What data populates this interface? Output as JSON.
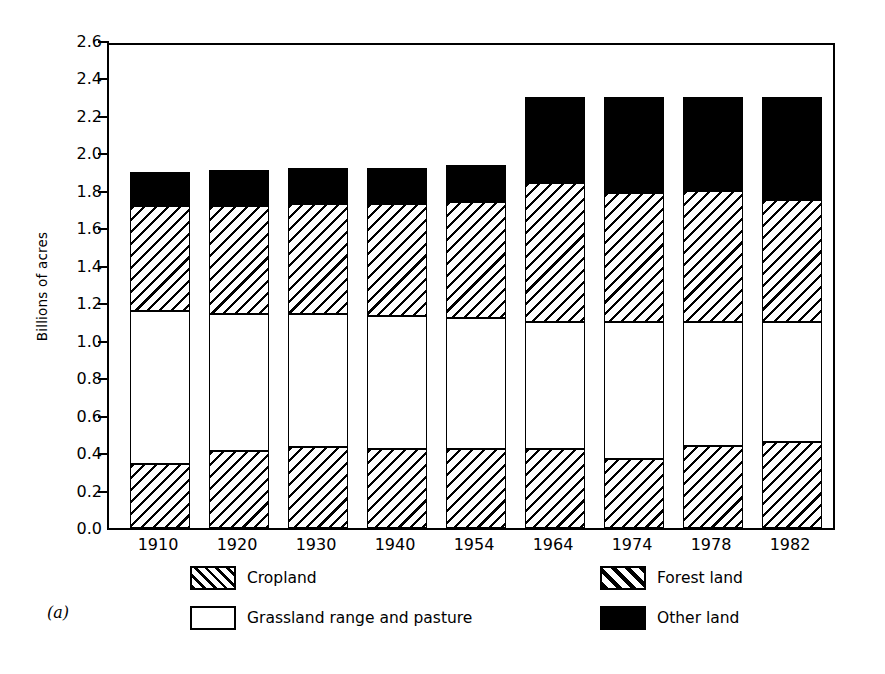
{
  "figure": {
    "panel_label": "(a)"
  },
  "chart_data": {
    "type": "bar",
    "subtype": "stacked-bar",
    "title": "",
    "xlabel": "",
    "ylabel": "Billions of acres",
    "ylim": [
      0.0,
      2.6
    ],
    "yticks": [
      "0.0",
      "0.2",
      "0.4",
      "0.6",
      "0.8",
      "1.0",
      "1.2",
      "1.4",
      "1.6",
      "1.8",
      "2.0",
      "2.2",
      "2.4",
      "2.6"
    ],
    "ytick_values": [
      0.0,
      0.2,
      0.4,
      0.6,
      0.8,
      1.0,
      1.2,
      1.4,
      1.6,
      1.8,
      2.0,
      2.2,
      2.4,
      2.6
    ],
    "grid": false,
    "legend_position": "below-plot",
    "categories": [
      "1910",
      "1920",
      "1930",
      "1940",
      "1954",
      "1964",
      "1974",
      "1978",
      "1982"
    ],
    "series": [
      {
        "name": "Cropland",
        "pattern": "diagonal-hatch",
        "values": [
          0.34,
          0.41,
          0.43,
          0.42,
          0.42,
          0.42,
          0.37,
          0.44,
          0.46
        ]
      },
      {
        "name": "Grassland range and pasture",
        "pattern": "solid-white",
        "values": [
          0.82,
          0.73,
          0.71,
          0.71,
          0.7,
          0.68,
          0.73,
          0.66,
          0.64
        ]
      },
      {
        "name": "Forest land",
        "pattern": "diagonal-hatch-wide",
        "values": [
          0.56,
          0.58,
          0.59,
          0.6,
          0.62,
          0.74,
          0.69,
          0.7,
          0.65
        ]
      },
      {
        "name": "Other land",
        "pattern": "solid-black",
        "values": [
          0.18,
          0.19,
          0.19,
          0.19,
          0.2,
          0.46,
          0.51,
          0.5,
          0.55
        ]
      }
    ],
    "stack_tops": {
      "cropland": [
        0.34,
        0.41,
        0.43,
        0.42,
        0.42,
        0.42,
        0.37,
        0.44,
        0.46
      ],
      "grassland": [
        1.16,
        1.14,
        1.14,
        1.13,
        1.12,
        1.1,
        1.1,
        1.1,
        1.1
      ],
      "forest": [
        1.72,
        1.72,
        1.73,
        1.73,
        1.74,
        1.84,
        1.79,
        1.8,
        1.75
      ],
      "other": [
        1.9,
        1.91,
        1.92,
        1.92,
        1.94,
        2.3,
        2.3,
        2.3,
        2.3
      ]
    },
    "totals": [
      1.9,
      1.91,
      1.92,
      1.92,
      1.94,
      2.3,
      2.3,
      2.3,
      2.3
    ],
    "legend": [
      {
        "label": "Cropland",
        "pattern": "diagonal-hatch"
      },
      {
        "label": "Forest land",
        "pattern": "diagonal-hatch-wide"
      },
      {
        "label": "Grassland range and pasture",
        "pattern": "solid-white"
      },
      {
        "label": "Other land",
        "pattern": "solid-black"
      }
    ],
    "colors": {
      "ink": "#000000",
      "background": "#ffffff"
    }
  }
}
